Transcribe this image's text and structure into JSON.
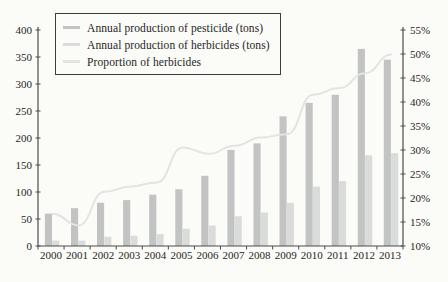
{
  "chart_data": {
    "type": "bar",
    "title": "",
    "xlabel": "",
    "ylabel_left": "",
    "ylabel_right": "",
    "grid": false,
    "legend_position": "top-left",
    "categories": [
      "2000",
      "2001",
      "2002",
      "2003",
      "2004",
      "2005",
      "2006",
      "2007",
      "2008",
      "2009",
      "2010",
      "2011",
      "2012",
      "2013"
    ],
    "series": [
      {
        "name": "Annual production of pesticide (tons)",
        "type": "bar",
        "axis": "left",
        "color": "#c1c4c3",
        "values": [
          60,
          70,
          80,
          85,
          95,
          105,
          130,
          178,
          190,
          240,
          265,
          280,
          365,
          345
        ]
      },
      {
        "name": "Annual production of herbicides (tons)",
        "type": "bar",
        "axis": "left",
        "color": "#d9dcdb",
        "values": [
          10,
          10,
          17,
          19,
          22,
          32,
          38,
          55,
          62,
          80,
          110,
          120,
          168,
          172
        ]
      },
      {
        "name": "Proportion of herbicides",
        "type": "line",
        "axis": "right",
        "unit": "%",
        "color": "#e3e5e3",
        "values": [
          16.7,
          14.3,
          21.3,
          22.4,
          23.2,
          30.5,
          29.2,
          30.9,
          32.6,
          33.3,
          41.5,
          42.9,
          46.0,
          49.9
        ]
      }
    ],
    "left_axis": {
      "min": 0,
      "max": 400,
      "step": 50,
      "tick_labels": [
        "0",
        "50",
        "100",
        "150",
        "200",
        "250",
        "300",
        "350",
        "400"
      ]
    },
    "right_axis": {
      "min": 10,
      "max": 55,
      "step": 5,
      "tick_labels": [
        "10%",
        "15%",
        "20%",
        "25%",
        "30%",
        "35%",
        "40%",
        "45%",
        "50%",
        "55%"
      ]
    }
  },
  "colors": {
    "background": "#fbfbf8",
    "axis": "#4c4c4c",
    "text": "#262626",
    "legend_border": "#3c3c3c"
  }
}
